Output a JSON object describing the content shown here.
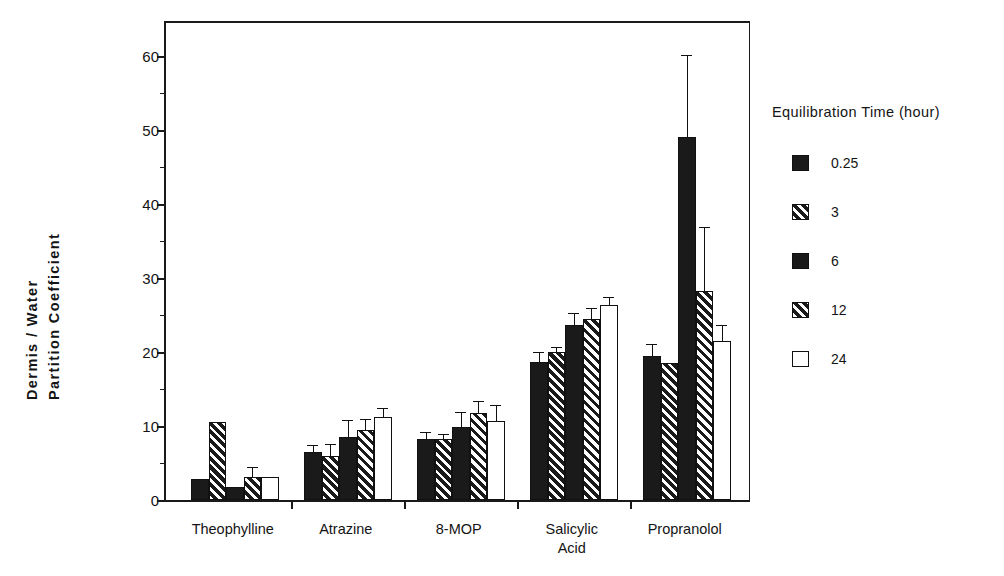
{
  "chart_data": {
    "type": "bar",
    "title": "",
    "subtitle": "",
    "xlabel": "",
    "ylabel": "Dermis / Water Partition Coefficient",
    "ylabel_lines": [
      "Dermis  /  Water",
      "Partition  Coefficient"
    ],
    "ylim": [
      0,
      65
    ],
    "ytick_values": [
      0,
      10,
      20,
      30,
      40,
      50,
      60
    ],
    "ytick_labels": [
      "0",
      "10",
      "20",
      "30",
      "40",
      "50",
      "60"
    ],
    "yminor_values": [
      5,
      15,
      25,
      35,
      45,
      55
    ],
    "grid": false,
    "legend_position": "right",
    "legend_title": "Equilibration Time (hour)",
    "categories": [
      "Theophylline",
      "Atrazine",
      "8-MOP",
      "Salicylic\nAcid",
      "Propranolol"
    ],
    "category_labels": [
      "Theophylline",
      "Atrazine",
      "8-MOP",
      "Salicylic Acid",
      "Propranolol"
    ],
    "series": [
      {
        "name": "0.25",
        "pattern": "solid-black",
        "values": [
          2.8,
          6.5,
          8.2,
          18.7,
          19.5
        ],
        "errors": [
          0.0,
          0.8,
          0.8,
          1.2,
          1.5
        ]
      },
      {
        "name": "3",
        "pattern": "hatch-dark",
        "values": [
          10.5,
          6.0,
          8.3,
          20.0,
          18.5
        ],
        "errors": [
          0.0,
          1.5,
          0.5,
          0.5,
          0.0
        ]
      },
      {
        "name": "6",
        "pattern": "solid-black",
        "values": [
          1.7,
          8.5,
          9.8,
          23.7,
          49.0
        ],
        "errors": [
          0.0,
          2.2,
          2.0,
          1.5,
          11.0
        ]
      },
      {
        "name": "12",
        "pattern": "hatch-light",
        "values": [
          3.1,
          9.5,
          11.7,
          24.5,
          28.3
        ],
        "errors": [
          1.2,
          1.3,
          1.5,
          1.3,
          8.5
        ]
      },
      {
        "name": "24",
        "pattern": "open-white",
        "values": [
          3.1,
          11.2,
          10.7,
          26.3,
          21.5
        ],
        "errors": [
          0.0,
          1.1,
          2.0,
          1.0,
          2.0
        ]
      }
    ]
  },
  "legend": {
    "title": "Equilibration Time (hour)",
    "items": [
      {
        "label": "0.25",
        "swatch": "solid-black-swatch"
      },
      {
        "label": "3",
        "swatch": "hatch-dark-swatch"
      },
      {
        "label": "6",
        "swatch": "solid-black-swatch"
      },
      {
        "label": "12",
        "swatch": "hatch-light-swatch"
      },
      {
        "label": "24",
        "swatch": "open-white-swatch"
      }
    ]
  }
}
